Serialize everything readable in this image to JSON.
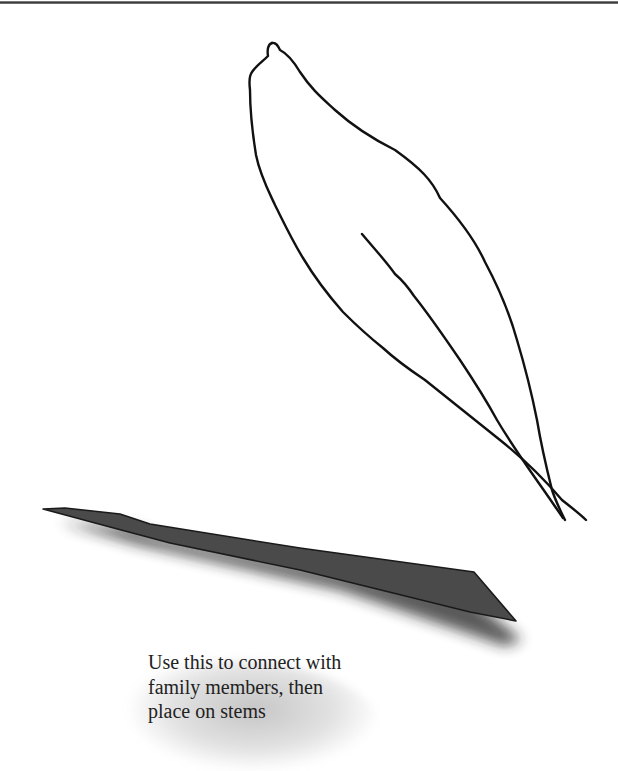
{
  "page": {
    "top_rule": true
  },
  "illustration": {
    "leaf": {
      "description": "hand-drawn leaf outline with midrib",
      "stroke_color": "#111111"
    },
    "stem": {
      "description": "dark tapered stem shape with drop shadow",
      "fill_color": "#4a4a4a",
      "shadow_color": "#2a2a2a"
    }
  },
  "caption": {
    "lines": [
      "Use this to connect with",
      "family members, then",
      "place on stems"
    ]
  }
}
